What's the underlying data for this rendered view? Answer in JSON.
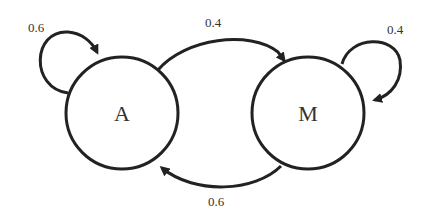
{
  "diagram": {
    "type": "markov-chain",
    "nodes": [
      {
        "id": "A",
        "label": "A"
      },
      {
        "id": "M",
        "label": "M"
      }
    ],
    "edges": [
      {
        "from": "A",
        "to": "A",
        "label": "0.6"
      },
      {
        "from": "A",
        "to": "M",
        "label": "0.4"
      },
      {
        "from": "M",
        "to": "M",
        "label": "0.4"
      },
      {
        "from": "M",
        "to": "A",
        "label": "0.6"
      }
    ],
    "colors": {
      "stroke": "#222222",
      "text": "#333333",
      "background": "#ffffff"
    }
  }
}
